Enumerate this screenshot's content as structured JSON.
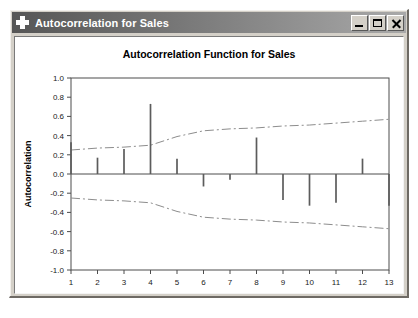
{
  "window": {
    "title": "Autocorrelation for Sales",
    "icon": "plus-icon",
    "buttons": {
      "minimize": "_",
      "maximize": "□",
      "close": "×"
    }
  },
  "chart_data": {
    "type": "bar",
    "title": "Autocorrelation Function for Sales",
    "xlabel": "Lag",
    "ylabel": "Autocorrelation",
    "categories": [
      1,
      2,
      3,
      4,
      5,
      6,
      7,
      8,
      9,
      10,
      11,
      12,
      13
    ],
    "values": [
      0.33,
      0.17,
      0.26,
      0.73,
      0.16,
      -0.13,
      -0.06,
      0.38,
      -0.27,
      -0.33,
      -0.3,
      0.16,
      -0.33
    ],
    "series": [
      {
        "name": "Autocorrelation",
        "values": [
          0.33,
          0.17,
          0.26,
          0.73,
          0.16,
          -0.13,
          -0.06,
          0.38,
          -0.27,
          -0.33,
          -0.3,
          0.16,
          -0.33
        ]
      },
      {
        "name": "Upper confidence limit",
        "values": [
          0.25,
          0.27,
          0.28,
          0.3,
          0.39,
          0.45,
          0.47,
          0.48,
          0.5,
          0.51,
          0.53,
          0.55,
          0.57
        ]
      },
      {
        "name": "Lower confidence limit",
        "values": [
          -0.25,
          -0.27,
          -0.28,
          -0.3,
          -0.39,
          -0.45,
          -0.47,
          -0.48,
          -0.5,
          -0.51,
          -0.53,
          -0.55,
          -0.57
        ]
      }
    ],
    "ylim": [
      -1.0,
      1.0
    ],
    "xlim": [
      1,
      13
    ],
    "ytick_labels": [
      "1.0",
      "0.8",
      "0.6",
      "0.4",
      "0.2",
      "0.0",
      "-0.2",
      "-0.4",
      "-0.6",
      "-0.8",
      "-1.0"
    ],
    "ytick_values": [
      1.0,
      0.8,
      0.6,
      0.4,
      0.2,
      0.0,
      -0.2,
      -0.4,
      -0.6,
      -0.8,
      -1.0
    ],
    "xtick_labels": [
      "1",
      "2",
      "3",
      "4",
      "5",
      "6",
      "7",
      "8",
      "9",
      "10",
      "11",
      "12",
      "13"
    ],
    "grid": false,
    "legend": "none",
    "colors": {
      "bar": "#5c5c5c",
      "confidence_band": "#8d8d8d",
      "axis": "#4c4c4c",
      "plot_background": "#ffffff"
    }
  }
}
